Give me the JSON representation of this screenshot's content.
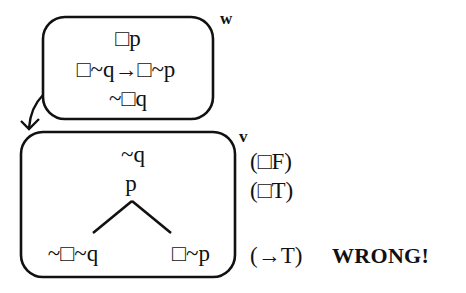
{
  "diagram": {
    "worlds": [
      {
        "id": "w",
        "label": "w",
        "lines": [
          "□p",
          "□~q→□~p",
          "~□q"
        ]
      },
      {
        "id": "v",
        "label": "v",
        "lines": [
          "~q",
          "p"
        ],
        "branches": {
          "left": "~□~q",
          "right": "□~p"
        }
      }
    ],
    "arrow": {
      "from": "w",
      "to": "v"
    },
    "justifications": [
      "(□F)",
      "(□T)",
      "(→T)"
    ],
    "verdict": "WRONG!",
    "colors": {
      "ink": "#111111",
      "background": "#ffffff"
    }
  }
}
